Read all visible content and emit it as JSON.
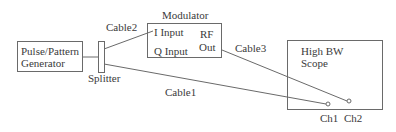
{
  "diagram": {
    "nodes": {
      "generator": {
        "line1": "Pulse/Pattern",
        "line2": "Generator"
      },
      "splitter": {
        "label": "Splitter"
      },
      "modulator": {
        "title": "Modulator",
        "i_input": "I Input",
        "q_input": "Q Input",
        "rf_out_line1": "RF",
        "rf_out_line2": "Out"
      },
      "scope": {
        "line1": "High BW",
        "line2": "Scope",
        "ch1": "Ch1",
        "ch2": "Ch2"
      }
    },
    "edges": {
      "cable1": "Cable1",
      "cable2": "Cable2",
      "cable3": "Cable3"
    },
    "colors": {
      "line": "#6a6a6a",
      "text": "#3a3a3a",
      "background": "#ffffff"
    }
  }
}
